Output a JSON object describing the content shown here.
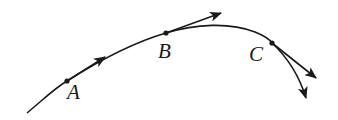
{
  "diagram": {
    "stroke_color": "#1a1a1a",
    "background": "#ffffff",
    "points": [
      {
        "label": "A",
        "x": 67,
        "y": 81,
        "label_x": 67,
        "label_y": 83
      },
      {
        "label": "B",
        "x": 166,
        "y": 33,
        "label_x": 158,
        "label_y": 42
      },
      {
        "label": "C",
        "x": 272,
        "y": 43,
        "label_x": 249,
        "label_y": 45
      }
    ],
    "tangent_vectors": [
      {
        "from": "A",
        "to_x": 105,
        "to_y": 57
      },
      {
        "from": "B",
        "to_x": 221,
        "to_y": 13
      },
      {
        "from": "C",
        "to_x": 316,
        "to_y": 78
      }
    ],
    "trajectory_end_arrow": {
      "x": 306,
      "y": 98
    }
  }
}
